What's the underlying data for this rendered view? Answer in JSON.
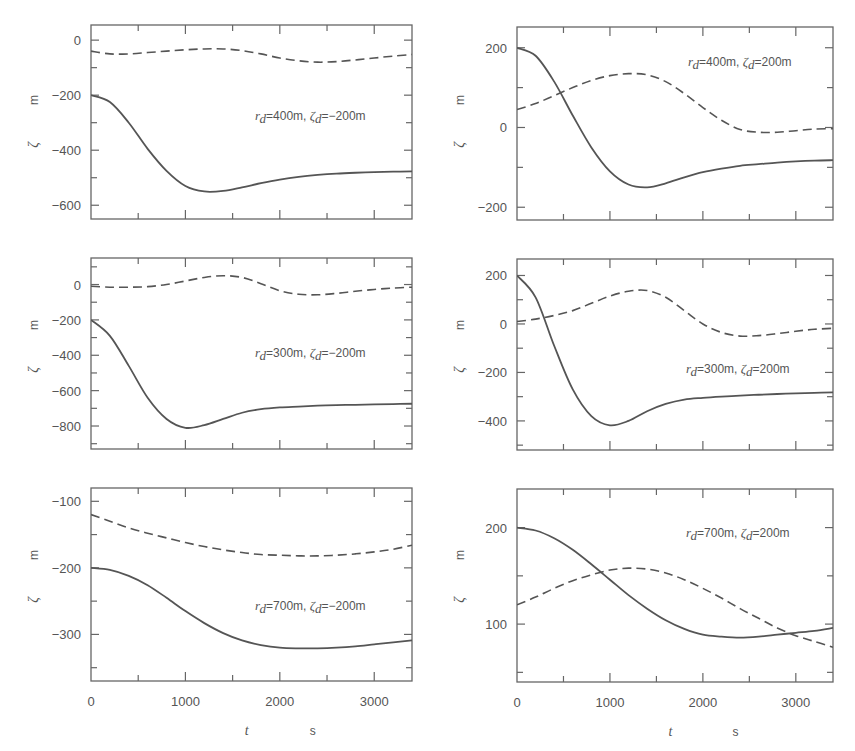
{
  "figure": {
    "xlabel": "t",
    "xunit": "s",
    "ylabel": "ζ",
    "yunit": "m",
    "colors": {
      "line": "#555555",
      "frame": "#666666",
      "text": "#555555"
    }
  },
  "chart_data": [
    {
      "type": "line",
      "panel": "top-left",
      "annotation": {
        "r_d": "400m",
        "zeta_d": "-200m",
        "text": "r_d=400m,  ζ_d=-200m"
      },
      "xlabel": "",
      "ylabel": "ζ m",
      "xlim": [
        0,
        3400
      ],
      "ylim": [
        -650,
        55
      ],
      "xticks": [
        0,
        500,
        1000,
        1500,
        2000,
        2500,
        3000
      ],
      "yticks": [
        0,
        -200,
        -400,
        -600
      ],
      "ytick_labels": [
        "0",
        "-200",
        "-400",
        "-600"
      ],
      "yminor": [
        -100,
        -300,
        -500
      ],
      "x": [
        0,
        200,
        400,
        600,
        800,
        1000,
        1200,
        1400,
        1600,
        1800,
        2000,
        2200,
        2400,
        2600,
        2800,
        3000,
        3200,
        3400
      ],
      "series": [
        {
          "name": "solid",
          "style": "solid",
          "values": [
            -200,
            -225,
            -300,
            -395,
            -475,
            -530,
            -550,
            -548,
            -535,
            -520,
            -507,
            -497,
            -490,
            -485,
            -482,
            -480,
            -478,
            -477
          ]
        },
        {
          "name": "dashed",
          "style": "dashed",
          "values": [
            -40,
            -50,
            -50,
            -45,
            -40,
            -35,
            -32,
            -32,
            -38,
            -50,
            -65,
            -75,
            -80,
            -78,
            -72,
            -65,
            -58,
            -52
          ]
        }
      ]
    },
    {
      "type": "line",
      "panel": "top-right",
      "annotation": {
        "r_d": "400m",
        "zeta_d": "200m",
        "text": "r_d=400m,  ζ_d=200m"
      },
      "xlabel": "",
      "ylabel": "ζ m",
      "xlim": [
        0,
        3400
      ],
      "ylim": [
        -232,
        252
      ],
      "xticks": [
        0,
        500,
        1000,
        1500,
        2000,
        2500,
        3000
      ],
      "yticks": [
        200,
        0,
        -200
      ],
      "ytick_labels": [
        "200",
        "0",
        "-200"
      ],
      "yminor": [
        100,
        -100
      ],
      "x": [
        0,
        200,
        400,
        600,
        800,
        1000,
        1200,
        1400,
        1600,
        1800,
        2000,
        2200,
        2400,
        2600,
        2800,
        3000,
        3200,
        3400
      ],
      "series": [
        {
          "name": "solid",
          "style": "solid",
          "values": [
            200,
            180,
            115,
            30,
            -50,
            -110,
            -143,
            -150,
            -140,
            -125,
            -112,
            -103,
            -96,
            -92,
            -88,
            -85,
            -83,
            -82
          ]
        },
        {
          "name": "dashed",
          "style": "dashed",
          "values": [
            45,
            60,
            80,
            100,
            118,
            130,
            135,
            132,
            115,
            85,
            50,
            18,
            -5,
            -12,
            -12,
            -8,
            -4,
            -3
          ]
        }
      ]
    },
    {
      "type": "line",
      "panel": "middle-left",
      "annotation": {
        "r_d": "300m",
        "zeta_d": "-200m",
        "text": "r_d=300m,  ζ_d=-200m"
      },
      "xlabel": "",
      "ylabel": "ζ m",
      "xlim": [
        0,
        3400
      ],
      "ylim": [
        -930,
        150
      ],
      "xticks": [
        0,
        500,
        1000,
        1500,
        2000,
        2500,
        3000
      ],
      "yticks": [
        0,
        -200,
        -400,
        -600,
        -800
      ],
      "ytick_labels": [
        "0",
        "-200",
        "-400",
        "-600",
        "-800"
      ],
      "yminor": [
        100,
        -100,
        -300,
        -500,
        -700,
        -900
      ],
      "x": [
        0,
        200,
        400,
        600,
        800,
        1000,
        1200,
        1400,
        1600,
        1800,
        2000,
        2200,
        2400,
        2600,
        2800,
        3000,
        3200,
        3400
      ],
      "series": [
        {
          "name": "solid",
          "style": "solid",
          "values": [
            -200,
            -290,
            -460,
            -640,
            -760,
            -810,
            -795,
            -760,
            -725,
            -705,
            -695,
            -690,
            -685,
            -682,
            -680,
            -678,
            -676,
            -674
          ]
        },
        {
          "name": "dashed",
          "style": "dashed",
          "values": [
            -10,
            -15,
            -15,
            -12,
            0,
            20,
            40,
            50,
            40,
            5,
            -35,
            -55,
            -58,
            -50,
            -38,
            -28,
            -20,
            -15
          ]
        }
      ]
    },
    {
      "type": "line",
      "panel": "middle-right",
      "annotation": {
        "r_d": "300m",
        "zeta_d": "200m",
        "text": "r_d=300m,  ζ_d=200m"
      },
      "xlabel": "",
      "ylabel": "ζ m",
      "xlim": [
        0,
        3400
      ],
      "ylim": [
        -520,
        268
      ],
      "xticks": [
        0,
        500,
        1000,
        1500,
        2000,
        2500,
        3000
      ],
      "yticks": [
        200,
        0,
        -200,
        -400
      ],
      "ytick_labels": [
        "200",
        "0",
        "-200",
        "-400"
      ],
      "yminor": [
        100,
        -100,
        -300,
        -500
      ],
      "x": [
        0,
        200,
        400,
        600,
        800,
        1000,
        1200,
        1400,
        1600,
        1800,
        2000,
        2200,
        2400,
        2600,
        2800,
        3000,
        3200,
        3400
      ],
      "series": [
        {
          "name": "solid",
          "style": "solid",
          "values": [
            200,
            110,
            -90,
            -270,
            -380,
            -418,
            -400,
            -360,
            -330,
            -312,
            -305,
            -300,
            -296,
            -292,
            -289,
            -286,
            -284,
            -282
          ]
        },
        {
          "name": "dashed",
          "style": "dashed",
          "values": [
            10,
            20,
            35,
            55,
            85,
            115,
            135,
            138,
            110,
            55,
            0,
            -35,
            -50,
            -48,
            -40,
            -30,
            -22,
            -18
          ]
        }
      ]
    },
    {
      "type": "line",
      "panel": "bottom-left",
      "annotation": {
        "r_d": "700m",
        "zeta_d": "-200m",
        "text": "r_d=700m,  ζ_d=-200m"
      },
      "xlabel": "t s",
      "ylabel": "ζ m",
      "xlim": [
        0,
        3400
      ],
      "ylim": [
        -370,
        -80
      ],
      "xticks": [
        0,
        500,
        1000,
        1500,
        2000,
        2500,
        3000
      ],
      "xtick_labels": [
        "0",
        "1000",
        "2000",
        "3000"
      ],
      "yticks": [
        -100,
        -200,
        -300
      ],
      "ytick_labels": [
        "-100",
        "-200",
        "-300"
      ],
      "yminor": [
        -150,
        -250,
        -350
      ],
      "x": [
        0,
        200,
        400,
        600,
        800,
        1000,
        1200,
        1400,
        1600,
        1800,
        2000,
        2200,
        2400,
        2600,
        2800,
        3000,
        3200,
        3400
      ],
      "series": [
        {
          "name": "solid",
          "style": "solid",
          "values": [
            -200,
            -203,
            -212,
            -226,
            -245,
            -265,
            -283,
            -298,
            -309,
            -316,
            -320,
            -321,
            -321,
            -320,
            -318,
            -315,
            -312,
            -309
          ]
        },
        {
          "name": "dashed",
          "style": "dashed",
          "values": [
            -120,
            -130,
            -140,
            -148,
            -155,
            -162,
            -168,
            -173,
            -177,
            -180,
            -181,
            -182,
            -182,
            -181,
            -179,
            -176,
            -172,
            -166
          ]
        }
      ]
    },
    {
      "type": "line",
      "panel": "bottom-right",
      "annotation": {
        "r_d": "700m",
        "zeta_d": "200m",
        "text": "r_d=700m,  ζ_d=200m"
      },
      "xlabel": "t s",
      "ylabel": "ζ m",
      "xlim": [
        0,
        3400
      ],
      "ylim": [
        40,
        240
      ],
      "xticks": [
        0,
        500,
        1000,
        1500,
        2000,
        2500,
        3000
      ],
      "xtick_labels": [
        "0",
        "1000",
        "2000",
        "3000"
      ],
      "yticks": [
        200,
        100
      ],
      "ytick_labels": [
        "200",
        "100"
      ],
      "yminor": [
        150,
        50
      ],
      "x": [
        0,
        200,
        400,
        600,
        800,
        1000,
        1200,
        1400,
        1600,
        1800,
        2000,
        2200,
        2400,
        2600,
        2800,
        3000,
        3200,
        3400
      ],
      "series": [
        {
          "name": "solid",
          "style": "solid",
          "values": [
            200,
            197,
            189,
            177,
            162,
            146,
            130,
            116,
            104,
            95,
            89,
            87,
            86,
            87,
            89,
            91,
            93,
            96
          ]
        },
        {
          "name": "dashed",
          "style": "dashed",
          "values": [
            120,
            128,
            137,
            145,
            151,
            156,
            158,
            157,
            153,
            146,
            137,
            127,
            116,
            106,
            96,
            88,
            82,
            76
          ]
        }
      ]
    }
  ],
  "layout": {
    "panels": [
      {
        "x0": 91,
        "x1": 412,
        "y0": 25,
        "y1": 219,
        "ylabel_x": 34,
        "yaxis_label_top": 100
      },
      {
        "x0": 517,
        "x1": 833,
        "y0": 27,
        "y1": 220,
        "ylabel_x": 460,
        "yaxis_label_top": 100
      },
      {
        "x0": 91,
        "x1": 412,
        "y0": 258,
        "y1": 449,
        "ylabel_x": 34,
        "yaxis_label_top": 325
      },
      {
        "x0": 517,
        "x1": 833,
        "y0": 259,
        "y1": 450,
        "ylabel_x": 460,
        "yaxis_label_top": 325
      },
      {
        "x0": 91,
        "x1": 412,
        "y0": 488,
        "y1": 681,
        "ylabel_x": 34,
        "yaxis_label_top": 555
      },
      {
        "x0": 517,
        "x1": 833,
        "y0": 489,
        "y1": 682,
        "ylabel_x": 460,
        "yaxis_label_top": 555
      }
    ],
    "annotation_pos": [
      {
        "x": 255,
        "y": 120
      },
      {
        "x": 688,
        "y": 66
      },
      {
        "x": 255,
        "y": 357
      },
      {
        "x": 686,
        "y": 373
      },
      {
        "x": 255,
        "y": 610
      },
      {
        "x": 686,
        "y": 537
      }
    ]
  }
}
